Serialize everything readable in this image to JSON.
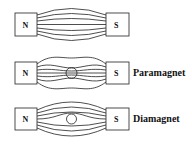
{
  "diagrams": [
    {
      "name": "no-material",
      "north": "N",
      "south": "S",
      "label": ""
    },
    {
      "name": "paramagnet",
      "north": "N",
      "south": "S",
      "label": "Paramagnet"
    },
    {
      "name": "diamagnet",
      "north": "N",
      "south": "S",
      "label": "Diamagnet"
    }
  ],
  "colors": {
    "stroke": "#222222",
    "background": "#ffffff"
  }
}
